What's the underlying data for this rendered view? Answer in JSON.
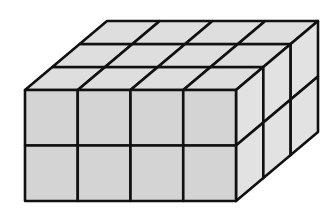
{
  "diagram": {
    "type": "unit-cube-prism",
    "dimensions": {
      "width_cubes": 4,
      "depth_cubes": 3,
      "height_cubes": 2
    },
    "total_cubes": 24,
    "geometry": {
      "front_left": 25,
      "front_top": 90,
      "front_right": 236,
      "front_bottom": 201,
      "depth_dx": 82,
      "depth_dy": -69
    },
    "colors": {
      "front_face": "#d4d4d4",
      "top_face": "#dedede",
      "side_face": "#e2e2e2",
      "stroke": "#111111",
      "background": "#ffffff"
    },
    "stroke_width": 2.6
  }
}
